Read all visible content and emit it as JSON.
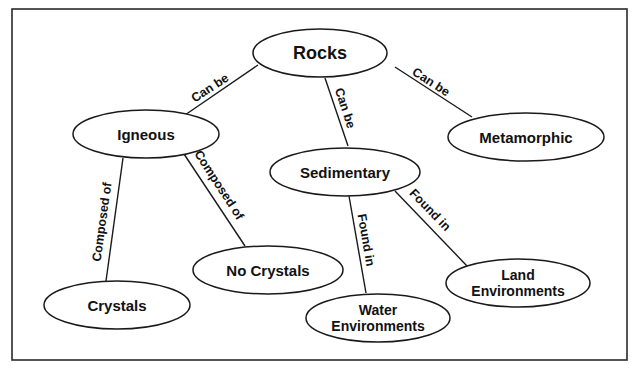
{
  "diagram": {
    "type": "concept-map",
    "colors": {
      "stroke": "#1a1a1a",
      "text": "#111111",
      "background": "#ffffff"
    },
    "nodes": [
      {
        "id": "rocks",
        "label": "Rocks",
        "lines": [
          "Rocks"
        ],
        "cx": 320,
        "cy": 53,
        "rx": 67,
        "ry": 24,
        "fs": 18
      },
      {
        "id": "igneous",
        "label": "Igneous",
        "lines": [
          "Igneous"
        ],
        "cx": 146,
        "cy": 134,
        "rx": 73,
        "ry": 24,
        "fs": 15
      },
      {
        "id": "metamorphic",
        "label": "Metamorphic",
        "lines": [
          "Metamorphic"
        ],
        "cx": 526,
        "cy": 137,
        "rx": 78,
        "ry": 24,
        "fs": 15
      },
      {
        "id": "sedimentary",
        "label": "Sedimentary",
        "lines": [
          "Sedimentary"
        ],
        "cx": 345,
        "cy": 172,
        "rx": 75,
        "ry": 24,
        "fs": 15
      },
      {
        "id": "no-crystals",
        "label": "No Crystals",
        "lines": [
          "No Crystals"
        ],
        "cx": 268,
        "cy": 270,
        "rx": 75,
        "ry": 24,
        "fs": 15
      },
      {
        "id": "crystals",
        "label": "Crystals",
        "lines": [
          "Crystals"
        ],
        "cx": 117,
        "cy": 305,
        "rx": 73,
        "ry": 24,
        "fs": 15
      },
      {
        "id": "land-environments",
        "label": "Land Environments",
        "lines": [
          "Land",
          "Environments"
        ],
        "cx": 518,
        "cy": 283,
        "rx": 72,
        "ry": 24,
        "fs": 14
      },
      {
        "id": "water-environments",
        "label": "Water Environments",
        "lines": [
          "Water",
          "Environments"
        ],
        "cx": 378,
        "cy": 318,
        "rx": 72,
        "ry": 24,
        "fs": 14
      }
    ],
    "edges": [
      {
        "from": "rocks",
        "to": "igneous",
        "label": "Can be",
        "x1": 258,
        "y1": 65,
        "x2": 185,
        "y2": 115,
        "lx": 210,
        "ly": 88,
        "angle": -33
      },
      {
        "from": "rocks",
        "to": "metamorphic",
        "label": "Can be",
        "x1": 395,
        "y1": 67,
        "x2": 472,
        "y2": 117,
        "lx": 431,
        "ly": 82,
        "angle": 33
      },
      {
        "from": "rocks",
        "to": "sedimentary",
        "label": "Can be",
        "x1": 325,
        "y1": 78,
        "x2": 348,
        "y2": 146,
        "lx": 345,
        "ly": 108,
        "angle": 72
      },
      {
        "from": "igneous",
        "to": "crystals",
        "label": "Composed of",
        "x1": 123,
        "y1": 158,
        "x2": 106,
        "y2": 281,
        "lx": 102,
        "ly": 222,
        "angle": -82
      },
      {
        "from": "igneous",
        "to": "no-crystals",
        "label": "Composed of",
        "x1": 184,
        "y1": 154,
        "x2": 245,
        "y2": 246,
        "lx": 219,
        "ly": 185,
        "angle": 57
      },
      {
        "from": "sedimentary",
        "to": "water-environments",
        "label": "Found in",
        "x1": 349,
        "y1": 196,
        "x2": 366,
        "y2": 293,
        "lx": 366,
        "ly": 240,
        "angle": 80
      },
      {
        "from": "sedimentary",
        "to": "land-environments",
        "label": "Found in",
        "x1": 395,
        "y1": 191,
        "x2": 468,
        "y2": 267,
        "lx": 430,
        "ly": 210,
        "angle": 46
      }
    ]
  }
}
